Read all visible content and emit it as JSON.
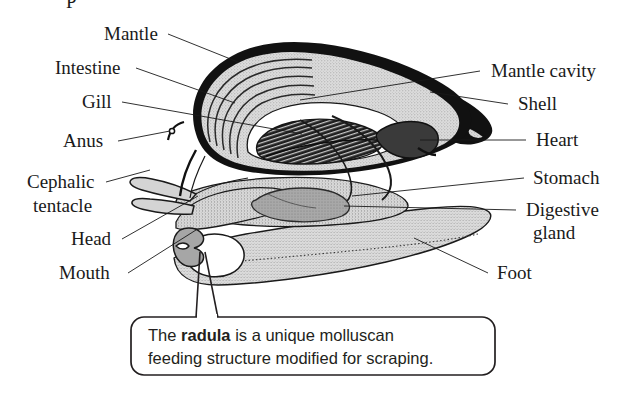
{
  "figure": {
    "kind": "anatomical-diagram",
    "background_color": "#ffffff",
    "ink_color": "#1a1a1a",
    "partial_top_text": "P",
    "labels_left": [
      {
        "id": "mantle",
        "text": "Mantle",
        "x": 104,
        "y": 40,
        "anchor": "start"
      },
      {
        "id": "intestine",
        "text": "Intestine",
        "x": 55,
        "y": 74,
        "anchor": "start"
      },
      {
        "id": "gill",
        "text": "Gill",
        "x": 82,
        "y": 108,
        "anchor": "start"
      },
      {
        "id": "anus",
        "text": "Anus",
        "x": 63,
        "y": 147,
        "anchor": "start"
      },
      {
        "id": "cephalic-1",
        "text": "Cephalic",
        "x": 27,
        "y": 188,
        "anchor": "start"
      },
      {
        "id": "cephalic-2",
        "text": "tentacle",
        "x": 33,
        "y": 212,
        "anchor": "start"
      },
      {
        "id": "head",
        "text": "Head",
        "x": 71,
        "y": 245,
        "anchor": "start"
      },
      {
        "id": "mouth",
        "text": "Mouth",
        "x": 59,
        "y": 279,
        "anchor": "start"
      }
    ],
    "labels_right": [
      {
        "id": "mantle-cavity",
        "text": "Mantle cavity",
        "x": 491,
        "y": 77,
        "anchor": "start"
      },
      {
        "id": "shell",
        "text": "Shell",
        "x": 518,
        "y": 110,
        "anchor": "start"
      },
      {
        "id": "heart",
        "text": "Heart",
        "x": 536,
        "y": 146,
        "anchor": "start"
      },
      {
        "id": "stomach",
        "text": "Stomach",
        "x": 533,
        "y": 184,
        "anchor": "start"
      },
      {
        "id": "digestive-1",
        "text": "Digestive",
        "x": 526,
        "y": 216,
        "anchor": "start"
      },
      {
        "id": "digestive-2",
        "text": "gland",
        "x": 533,
        "y": 239,
        "anchor": "start"
      },
      {
        "id": "foot",
        "text": "Foot",
        "x": 497,
        "y": 279,
        "anchor": "start"
      }
    ],
    "callout": {
      "line1_pre": "The ",
      "line1_bold": "radula",
      "line1_post": " is a unique molluscan",
      "line2": "feeding structure modified for scraping.",
      "border_color": "#231f20",
      "fill_color": "#ffffff"
    },
    "palette": {
      "outline": "#111111",
      "shell_fill": "#d2d2d2",
      "body_fill": "#d9d9d9",
      "foot_fill": "#d5d5d5",
      "gill_dark": "#2b2b2b",
      "heart_dark": "#3a3a3a",
      "gland_gray": "#a9a9a9",
      "cavity_white": "#ffffff"
    }
  }
}
